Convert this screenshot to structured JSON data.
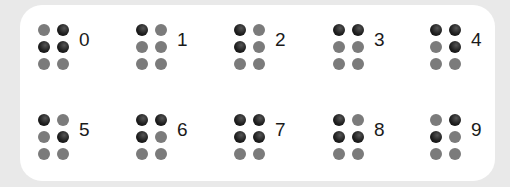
{
  "colors": {
    "background": "#e9e9e9",
    "card": "#ffffff",
    "dot_raised": "#1e1e1e",
    "dot_flat": "#7b7b7b",
    "digit_text": "#1a1a1a"
  },
  "dot_order": [
    "top-left",
    "top-right",
    "middle-left",
    "middle-right",
    "bottom-left",
    "bottom-right"
  ],
  "cells": [
    {
      "digit": "0",
      "dots": [
        0,
        1,
        1,
        1,
        0,
        0
      ]
    },
    {
      "digit": "1",
      "dots": [
        1,
        0,
        0,
        0,
        0,
        0
      ]
    },
    {
      "digit": "2",
      "dots": [
        1,
        0,
        1,
        0,
        0,
        0
      ]
    },
    {
      "digit": "3",
      "dots": [
        1,
        1,
        0,
        0,
        0,
        0
      ]
    },
    {
      "digit": "4",
      "dots": [
        1,
        1,
        0,
        1,
        0,
        0
      ]
    },
    {
      "digit": "5",
      "dots": [
        1,
        0,
        0,
        1,
        0,
        0
      ]
    },
    {
      "digit": "6",
      "dots": [
        1,
        1,
        1,
        0,
        0,
        0
      ]
    },
    {
      "digit": "7",
      "dots": [
        1,
        1,
        1,
        1,
        0,
        0
      ]
    },
    {
      "digit": "8",
      "dots": [
        1,
        0,
        1,
        1,
        0,
        0
      ]
    },
    {
      "digit": "9",
      "dots": [
        0,
        1,
        1,
        0,
        0,
        0
      ]
    }
  ]
}
